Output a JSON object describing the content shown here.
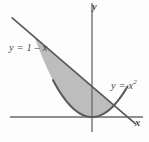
{
  "figure": {
    "background_color": "#fdfdfd",
    "curve_color": "#5a5a5a",
    "axis_color": "#6b6b6b",
    "shade_color": "#b9b9b9",
    "shade_stroke_color": "#4f4f4f",
    "labels": {
      "line_label": "y = 1 – x",
      "parabola_label_base": "y = x",
      "parabola_label_exponent": "2",
      "axis_y": "y",
      "axis_x": "x"
    }
  },
  "chart_data": {
    "type": "line",
    "xlabel": "x",
    "ylabel": "y",
    "grid": false,
    "legend": "inline-curve-labels",
    "xlim": [
      -2.6,
      1.45
    ],
    "ylim": [
      -0.45,
      3.7
    ],
    "origin_px": [
      92,
      117
    ],
    "px_per_unit_x": 35.5,
    "px_per_unit_y": 30.5,
    "series": [
      {
        "name": "y = 1 – x",
        "type": "line",
        "equation": "y = 1 - x",
        "slope": -1,
        "intercept": 1,
        "label": "y = 1 – x",
        "label_position_px": [
          9,
          43
        ],
        "endpoints_px": [
          [
            12,
            6
          ],
          [
            136,
            131
          ]
        ],
        "x_domain": [
          -2.25,
          1.22
        ]
      },
      {
        "name": "y = x²",
        "type": "parabola",
        "equation": "y = x^2",
        "vertex": [
          0,
          0
        ],
        "label": "y = x²",
        "label_position_px": [
          111,
          79
        ],
        "endpoints_px": [
          [
            53,
            5
          ],
          [
            127,
            5
          ]
        ],
        "x_domain": [
          -1.1,
          1.0
        ]
      }
    ],
    "shaded_region": {
      "label": "area between curves",
      "fill": "#b9b9b9",
      "upper_boundary": "y = 1 - x",
      "lower_boundary": "y = x^2",
      "intersections": [
        {
          "x": -1.618,
          "y": 2.618,
          "px": [
            62,
            57
          ]
        },
        {
          "x": 0.618,
          "y": 0.382,
          "px": [
            108,
            106
          ]
        }
      ]
    },
    "axes": {
      "x_axis_px": {
        "y": 117,
        "x_start": 10,
        "x_end": 143
      },
      "y_axis_px": {
        "x": 92,
        "y_start": 3,
        "y_end": 132
      },
      "tick_labels_x": [],
      "tick_labels_y": []
    }
  }
}
